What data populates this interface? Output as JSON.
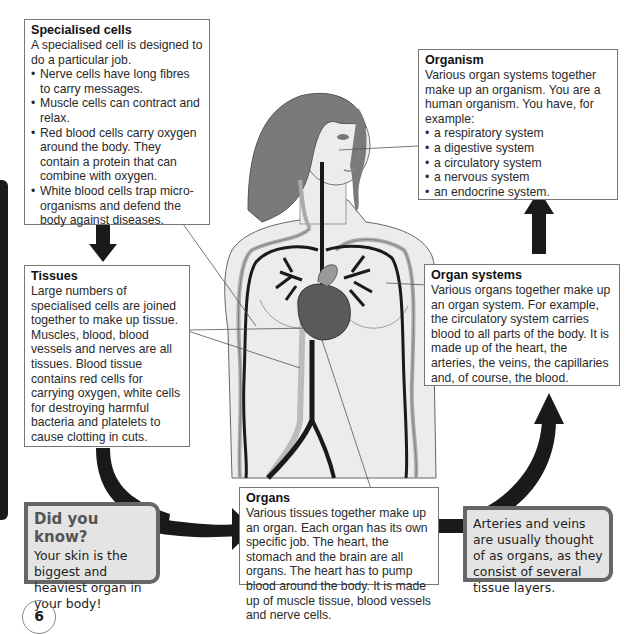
{
  "page": {
    "number": "6"
  },
  "specialised_cells": {
    "title": "Specialised cells",
    "intro": "A specialised cell is designed to do a particular job.",
    "bullets": [
      "Nerve cells have long fibres to carry messages.",
      "Muscle cells can contract and relax.",
      "Red blood cells carry oxygen around the body. They contain a protein that can combine with oxygen.",
      "White blood cells trap micro-organisms and defend the body against diseases."
    ]
  },
  "tissues": {
    "title": "Tissues",
    "text1": "Large numbers of specialised cells are joined together to make up tissue.",
    "text2": "Muscles, blood, blood vessels and nerves are all tissues. Blood tissue contains red cells for carrying oxygen, white cells for destroying harmful bacteria and platelets to cause clotting in cuts."
  },
  "organs": {
    "title": "Organs",
    "text": "Various tissues together make up an organ. Each organ has its own specific job. The heart, the stomach and the brain are all organs. The heart has to pump blood around the body. It is made up of muscle tissue, blood vessels and nerve cells."
  },
  "organ_systems": {
    "title": "Organ systems",
    "text": "Various organs together make up an organ system. For example, the circulatory system carries blood to all parts of the body. It is made up of the heart, the arteries, the veins, the capillaries and, of course, the blood."
  },
  "organism": {
    "title": "Organism",
    "intro": "Various organ systems together make up an organism. You are a human organism. You have, for example:",
    "bullets": [
      "a respiratory system",
      "a digestive system",
      "a circulatory system",
      "a nervous system",
      "an endocrine system."
    ]
  },
  "did_you_know": {
    "title": "Did you know?",
    "text": "Your skin is the biggest and heaviest organ in your body!"
  },
  "arteries_note": {
    "text": "Arteries and veins are usually thought of as organs, as they consist of several tissue layers."
  },
  "colors": {
    "arrow": "#1a1a1a",
    "callout_bg": "#e4e4e4",
    "callout_border": "#666666",
    "box_border": "#777777"
  }
}
